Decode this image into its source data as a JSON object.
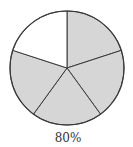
{
  "chart_data": {
    "type": "pie",
    "title": "",
    "slices": 5,
    "shaded_slices": 4,
    "values": [
      20,
      20,
      20,
      20,
      20
    ],
    "shaded": [
      true,
      true,
      true,
      true,
      false
    ],
    "caption": "80%",
    "start_angle_deg": -90
  },
  "colors": {
    "shaded": "#d6d6d6",
    "unshaded": "#ffffff",
    "stroke": "#3a3a3a"
  },
  "label": "80%"
}
